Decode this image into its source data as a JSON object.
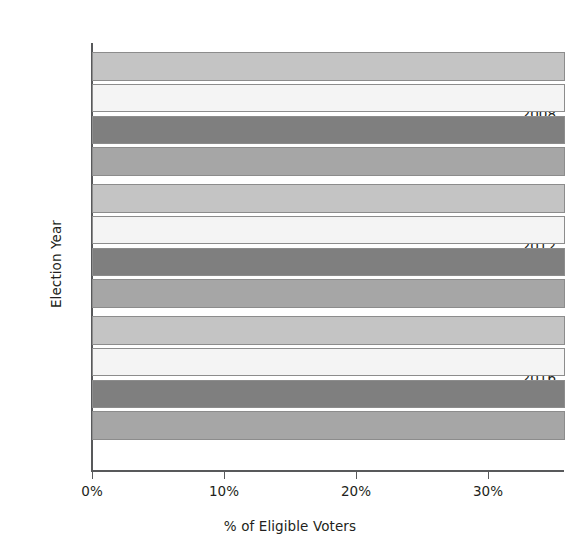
{
  "chart_data": {
    "type": "bar",
    "orientation": "horizontal",
    "title": "",
    "xlabel": "% of Eligible Voters",
    "ylabel": "Election Year",
    "categories": [
      "2008",
      "2012",
      "2016"
    ],
    "xlim": [
      0,
      35.8
    ],
    "xticks": [
      0,
      10,
      20,
      30
    ],
    "xtick_labels": [
      "0%",
      "10%",
      "20%",
      "30%"
    ],
    "grid": false,
    "legend": "none",
    "note": "All bars extend beyond the right edge of the visible image (clipped); values are at or above the plotted range limit.",
    "series": [
      {
        "name": "series-1",
        "color": "#c4c4c4",
        "values": [
          35.8,
          35.8,
          35.8
        ]
      },
      {
        "name": "series-2",
        "color": "#f4f4f4",
        "values": [
          35.8,
          35.8,
          35.8
        ]
      },
      {
        "name": "series-3",
        "color": "#7f7f7f",
        "values": [
          35.8,
          35.8,
          35.8
        ]
      },
      {
        "name": "series-4",
        "color": "#a6a6a6",
        "values": [
          35.8,
          35.8,
          35.8
        ]
      }
    ]
  },
  "axes": {
    "y_title": "Election Year",
    "x_title": "% of Eligible Voters",
    "y_labels": [
      "2008",
      "2012",
      "2016"
    ],
    "x_labels": [
      "0%",
      "10%",
      "20%",
      "30%"
    ]
  },
  "colors": {
    "background": "#ffffff",
    "axis": "#58595b",
    "text": "#231f20",
    "bar_stroke": "#8c8c8c",
    "bar_1": "#c4c4c4",
    "bar_2": "#f4f4f4",
    "bar_3": "#7f7f7f",
    "bar_4": "#a6a6a6"
  }
}
